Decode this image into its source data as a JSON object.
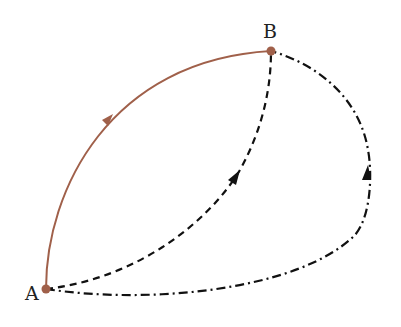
{
  "diagram": {
    "points": [
      {
        "id": "A",
        "label": "A",
        "x": 46,
        "y": 289
      },
      {
        "id": "B",
        "label": "B",
        "x": 271,
        "y": 51
      }
    ],
    "paths": [
      {
        "id": "path-1",
        "style": "solid",
        "color": "#a0604a",
        "from": "A",
        "to": "B",
        "direction": "A to B"
      },
      {
        "id": "path-2",
        "style": "dashed",
        "color": "#111111",
        "from": "A",
        "to": "B",
        "direction": "A to B"
      },
      {
        "id": "path-3",
        "style": "dash-dot",
        "color": "#111111",
        "from": "A",
        "to": "B",
        "direction": "A to B via right"
      }
    ],
    "colors": {
      "solid_path": "#a0604a",
      "point": "#a0604a",
      "dashed": "#111111"
    }
  }
}
